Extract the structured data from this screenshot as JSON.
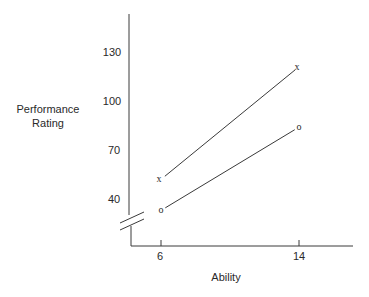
{
  "chart_data": {
    "type": "line",
    "title": "",
    "xlabel": "Ability",
    "ylabel": [
      "Performance",
      "Rating"
    ],
    "x": [
      6,
      14
    ],
    "x_ticks": [
      "6",
      "14"
    ],
    "y_ticks": [
      "40",
      "70",
      "100",
      "130"
    ],
    "ylim": [
      25,
      160
    ],
    "axis_break": "y",
    "grid": false,
    "legend": null,
    "series": [
      {
        "name": "x",
        "marker": "x",
        "values": [
          52,
          121
        ]
      },
      {
        "name": "o",
        "marker": "o",
        "values": [
          33,
          84
        ]
      }
    ]
  }
}
